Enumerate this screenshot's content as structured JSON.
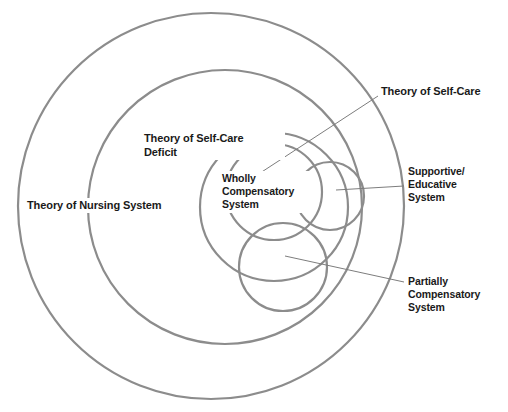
{
  "diagram": {
    "stroke_color": "#8c8c8c",
    "leader_color": "#7d7d7d",
    "text_color": "#1a1a1a",
    "background": "#ffffff",
    "rings": [
      {
        "id": "nursing-system",
        "label": "Theory of Nursing System",
        "cx": 211,
        "cy": 206,
        "r": 193
      },
      {
        "id": "self-care-deficit",
        "label": "Theory of Self-Care\nDeficit",
        "cx": 225,
        "cy": 207,
        "r": 137
      },
      {
        "id": "self-care",
        "label": "Theory of Self-Care",
        "cx": 274,
        "cy": 207,
        "r": 74
      }
    ],
    "lobes": [
      {
        "id": "wholly-compensatory-system",
        "label": "Wholly\nCompensatory\nSystem",
        "cx": 274,
        "cy": 192,
        "r": 48
      },
      {
        "id": "supportive-educative-system",
        "label": "Supportive/\nEducative\nSystem",
        "cx": 330,
        "cy": 196,
        "r": 34
      },
      {
        "id": "partially-compensatory-system",
        "label": "Partially\nCompensatory\nSystem",
        "cx": 283,
        "cy": 267,
        "r": 44
      }
    ],
    "leaders": [
      {
        "id": "leader-self-care",
        "x1": 378,
        "y1": 96,
        "x2": 228,
        "y2": 194
      },
      {
        "id": "leader-supportive",
        "x1": 404,
        "y1": 186,
        "x2": 336,
        "y2": 190
      },
      {
        "id": "leader-partially",
        "x1": 404,
        "y1": 282,
        "x2": 285,
        "y2": 256
      }
    ]
  }
}
